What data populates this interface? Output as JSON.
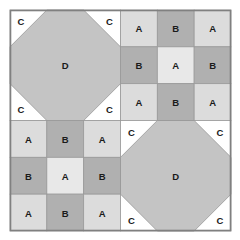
{
  "figure": {
    "name": "square-dissection-tiling",
    "background_color": "#ffffff",
    "outer_border_color": "#808080",
    "cell_border_color": "#9a9a9a",
    "label_color": "#1a1a1a",
    "geometry": {
      "x0": 10,
      "y0": 10,
      "size": 221,
      "quadrant_size": 110.5,
      "cell_size": 36.83
    },
    "palette": {
      "A": "#dcdcdc",
      "A_center": "#e8e8e8",
      "B": "#b0b0b0",
      "C": "#ffffff",
      "D": "#c4c4c4"
    },
    "quadrants": [
      {
        "id": "top-left",
        "type": "octagon",
        "col": 0,
        "row": 0,
        "center_label": "D",
        "center_fill": "#c4c4c4",
        "corner_label": "C",
        "corner_fill": "#ffffff",
        "corners": [
          "C",
          "C",
          "C",
          "C"
        ]
      },
      {
        "id": "top-right",
        "type": "grid",
        "col": 1,
        "row": 0,
        "cells": [
          {
            "label": "A",
            "fill": "#dcdcdc"
          },
          {
            "label": "B",
            "fill": "#b0b0b0"
          },
          {
            "label": "A",
            "fill": "#dcdcdc"
          },
          {
            "label": "B",
            "fill": "#b0b0b0"
          },
          {
            "label": "A",
            "fill": "#e8e8e8"
          },
          {
            "label": "B",
            "fill": "#b0b0b0"
          },
          {
            "label": "A",
            "fill": "#dcdcdc"
          },
          {
            "label": "B",
            "fill": "#b0b0b0"
          },
          {
            "label": "A",
            "fill": "#dcdcdc"
          }
        ]
      },
      {
        "id": "bottom-left",
        "type": "grid",
        "col": 0,
        "row": 1,
        "cells": [
          {
            "label": "A",
            "fill": "#dcdcdc"
          },
          {
            "label": "B",
            "fill": "#b0b0b0"
          },
          {
            "label": "A",
            "fill": "#dcdcdc"
          },
          {
            "label": "B",
            "fill": "#b0b0b0"
          },
          {
            "label": "A",
            "fill": "#e8e8e8"
          },
          {
            "label": "B",
            "fill": "#b0b0b0"
          },
          {
            "label": "A",
            "fill": "#dcdcdc"
          },
          {
            "label": "B",
            "fill": "#b0b0b0"
          },
          {
            "label": "A",
            "fill": "#dcdcdc"
          }
        ]
      },
      {
        "id": "bottom-right",
        "type": "octagon",
        "col": 1,
        "row": 1,
        "center_label": "D",
        "center_fill": "#c4c4c4",
        "corner_label": "C",
        "corner_fill": "#ffffff",
        "corners": [
          "C",
          "C",
          "C",
          "C"
        ]
      }
    ]
  }
}
